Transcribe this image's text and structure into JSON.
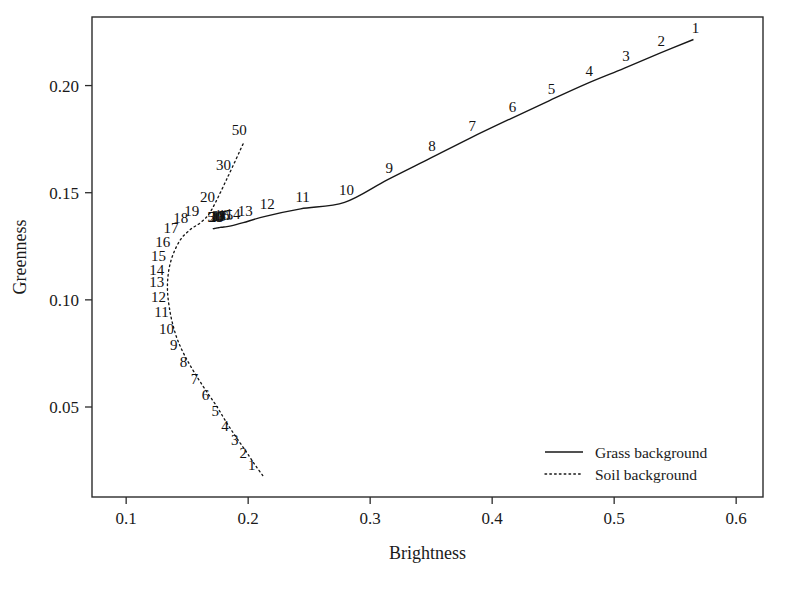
{
  "chart_data": {
    "type": "line",
    "title": "",
    "xlabel": "Brightness",
    "ylabel": "Greenness",
    "xlim": [
      0.072,
      0.622
    ],
    "ylim": [
      0.008,
      0.232
    ],
    "grid": false,
    "xticks": [
      "0.1",
      "0.2",
      "0.3",
      "0.4",
      "0.5",
      "0.6"
    ],
    "xtick_values": [
      0.1,
      0.2,
      0.3,
      0.4,
      0.5,
      0.6
    ],
    "yticks": [
      "0.05",
      "0.10",
      "0.15",
      "0.20"
    ],
    "ytick_values": [
      0.05,
      0.1,
      0.15,
      0.2
    ],
    "legend_position": "lower-right",
    "legend": [
      {
        "label": "Grass background",
        "style": "solid"
      },
      {
        "label": "Soil background",
        "style": "dotted"
      }
    ],
    "series": [
      {
        "name": "Grass background",
        "style": "solid",
        "point_labels": [
          "1",
          "2",
          "3",
          "4",
          "5",
          "6",
          "7",
          "8",
          "9",
          "10",
          "11",
          "12",
          "13",
          "14",
          "15",
          "16",
          "17",
          "18",
          "19",
          "20",
          "30",
          "50"
        ],
        "x": [
          0.565,
          0.537,
          0.508,
          0.478,
          0.447,
          0.415,
          0.382,
          0.349,
          0.314,
          0.279,
          0.243,
          0.214,
          0.196,
          0.186,
          0.18,
          0.177,
          0.175,
          0.174,
          0.173,
          0.1725,
          0.1715,
          0.171
        ],
        "y": [
          0.2215,
          0.215,
          0.208,
          0.201,
          0.193,
          0.1845,
          0.1755,
          0.166,
          0.156,
          0.1455,
          0.1425,
          0.139,
          0.136,
          0.1345,
          0.134,
          0.1338,
          0.1336,
          0.1335,
          0.1334,
          0.1333,
          0.1332,
          0.1331
        ]
      },
      {
        "name": "Soil background",
        "style": "dotted",
        "point_labels": [
          "1",
          "2",
          "3",
          "4",
          "5",
          "6",
          "7",
          "8",
          "9",
          "10",
          "11",
          "12",
          "13",
          "14",
          "15",
          "16",
          "17",
          "18",
          "19",
          "20",
          "30",
          "50"
        ],
        "x": [
          0.212,
          0.205,
          0.198,
          0.19,
          0.182,
          0.174,
          0.165,
          0.156,
          0.148,
          0.142,
          0.138,
          0.1355,
          0.134,
          0.134,
          0.1355,
          0.139,
          0.145,
          0.153,
          0.162,
          0.17,
          0.183,
          0.196
        ],
        "y": [
          0.018,
          0.0235,
          0.0295,
          0.036,
          0.043,
          0.0505,
          0.058,
          0.066,
          0.074,
          0.0815,
          0.089,
          0.096,
          0.103,
          0.109,
          0.1155,
          0.122,
          0.1285,
          0.133,
          0.1365,
          0.142,
          0.157,
          0.173
        ]
      }
    ],
    "annotations": {
      "description": "Two trajectories of Brightness vs Greenness with numbered points; soil background curve is dotted and traces a hook shape, grass background curve is solid and rises monotonically."
    }
  }
}
